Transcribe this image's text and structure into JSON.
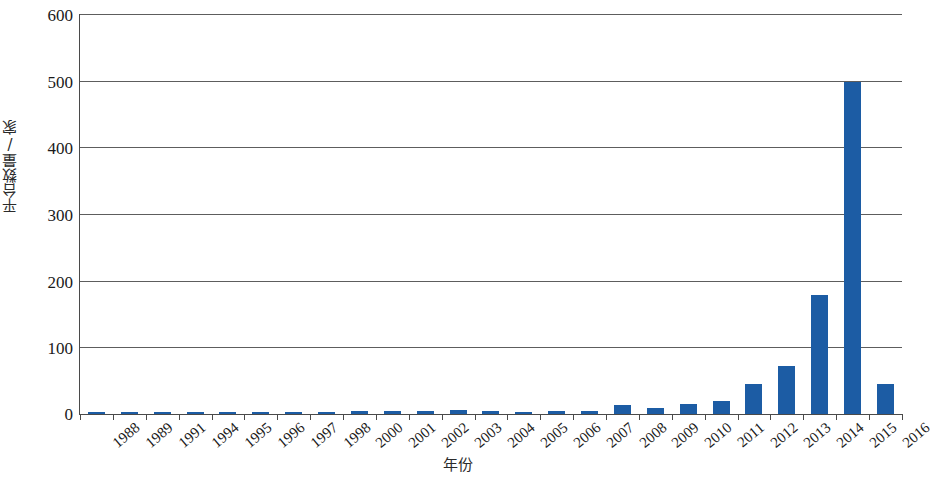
{
  "chart_data": {
    "type": "bar",
    "title": "",
    "subtitle": "",
    "xlabel": "年份",
    "ylabel": "平台数量/家",
    "categories": [
      "1988",
      "1989",
      "1991",
      "1994",
      "1995",
      "1996",
      "1997",
      "1998",
      "2000",
      "2001",
      "2002",
      "2003",
      "2004",
      "2005",
      "2006",
      "2007",
      "2008",
      "2009",
      "2010",
      "2011",
      "2012",
      "2013",
      "2014",
      "2015",
      "2016"
    ],
    "values": [
      2,
      2,
      2,
      2,
      1,
      1,
      1,
      3,
      4,
      4,
      4,
      6,
      4,
      3,
      4,
      5,
      13,
      9,
      15,
      19,
      45,
      72,
      178,
      498,
      45
    ],
    "series": [
      {
        "name": "平台数量",
        "color": "#1c5ca4",
        "values": [
          2,
          2,
          2,
          2,
          1,
          1,
          1,
          3,
          4,
          4,
          4,
          6,
          4,
          3,
          4,
          5,
          13,
          9,
          15,
          19,
          45,
          72,
          178,
          498,
          45
        ]
      }
    ],
    "ylim": [
      0,
      600
    ],
    "yticks": [
      0,
      100,
      200,
      300,
      400,
      500,
      600
    ],
    "ytick_labels": [
      "0",
      "100",
      "200",
      "300",
      "400",
      "500",
      "600"
    ],
    "grid": "horizontal",
    "legend": "none",
    "bar_color": "#1c5ca4",
    "axis_color": "#4a4a4a",
    "gridline_color": "#5d5d5d"
  }
}
